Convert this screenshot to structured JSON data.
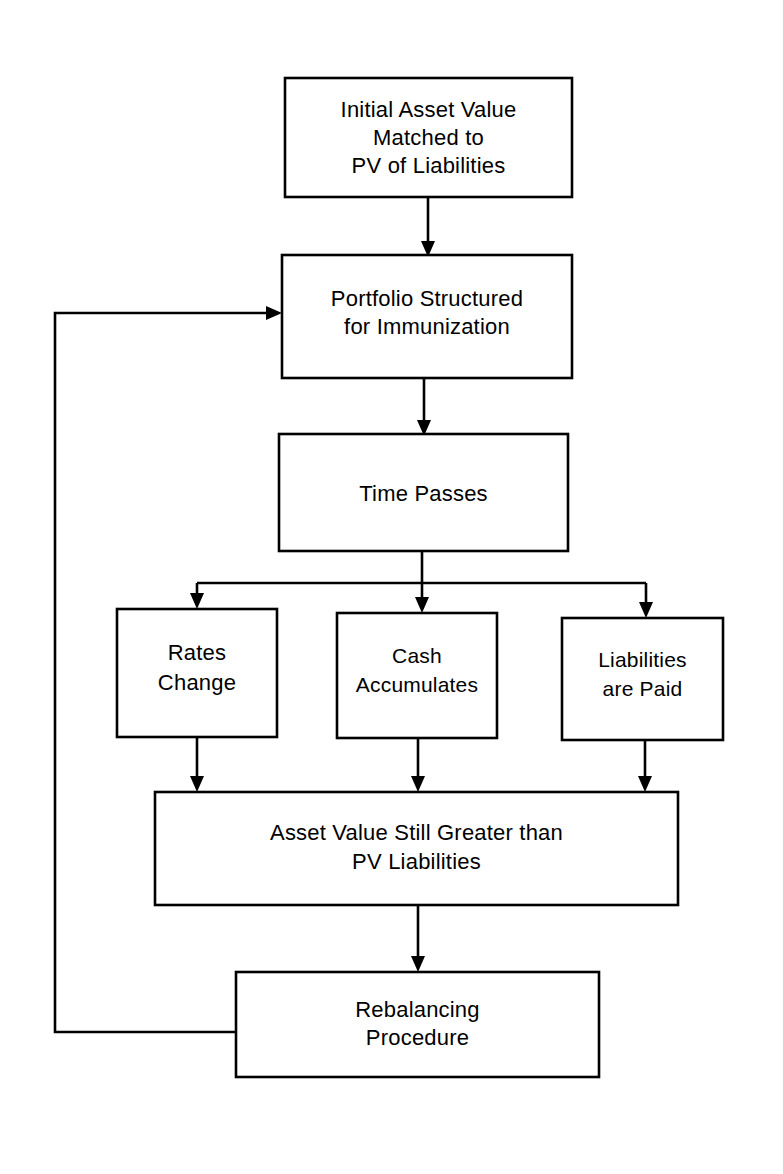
{
  "diagram": {
    "type": "flowchart",
    "background_color": "#ffffff",
    "line_color": "#000000",
    "box_fill": "#ffffff",
    "nodes": [
      {
        "id": "initial-asset-value",
        "lines": [
          "Initial Asset Value",
          "Matched to",
          "PV of Liabilities"
        ],
        "x": 285,
        "y": 78,
        "w": 287,
        "h": 119
      },
      {
        "id": "portfolio-structured",
        "lines": [
          "Portfolio Structured",
          "for Immunization"
        ],
        "x": 282,
        "y": 255,
        "w": 290,
        "h": 123
      },
      {
        "id": "time-passes",
        "lines": [
          "Time Passes"
        ],
        "x": 279,
        "y": 434,
        "w": 289,
        "h": 117
      },
      {
        "id": "rates-change",
        "lines": [
          "Rates",
          "Change"
        ],
        "x": 117,
        "y": 609,
        "w": 160,
        "h": 128
      },
      {
        "id": "cash-accumulates",
        "lines": [
          "Cash",
          "Accumulates"
        ],
        "x": 337,
        "y": 613,
        "w": 160,
        "h": 125
      },
      {
        "id": "liabilities-are-paid",
        "lines": [
          "Liabilities",
          "are  Paid"
        ],
        "x": 562,
        "y": 618,
        "w": 161,
        "h": 122
      },
      {
        "id": "asset-value-still-greater",
        "lines": [
          "Asset Value Still Greater than",
          "PV Liabilities"
        ],
        "x": 155,
        "y": 792,
        "w": 523,
        "h": 113
      },
      {
        "id": "rebalancing-procedure",
        "lines": [
          "Rebalancing",
          "Procedure"
        ],
        "x": 236,
        "y": 972,
        "w": 363,
        "h": 105
      }
    ],
    "edges": [
      {
        "id": "edge-initial-to-portfolio",
        "from": "initial-asset-value",
        "to": "portfolio-structured",
        "arrow": "down"
      },
      {
        "id": "edge-portfolio-to-time",
        "from": "portfolio-structured",
        "to": "time-passes",
        "arrow": "down"
      },
      {
        "id": "edge-time-to-rates",
        "from": "time-passes",
        "to": "rates-change",
        "arrow": "down"
      },
      {
        "id": "edge-time-to-cash",
        "from": "time-passes",
        "to": "cash-accumulates",
        "arrow": "down"
      },
      {
        "id": "edge-time-to-liabilities",
        "from": "time-passes",
        "to": "liabilities-are-paid",
        "arrow": "down"
      },
      {
        "id": "edge-rates-to-asset",
        "from": "rates-change",
        "to": "asset-value-still-greater",
        "arrow": "down"
      },
      {
        "id": "edge-cash-to-asset",
        "from": "cash-accumulates",
        "to": "asset-value-still-greater",
        "arrow": "down"
      },
      {
        "id": "edge-liabilities-to-asset",
        "from": "liabilities-are-paid",
        "to": "asset-value-still-greater",
        "arrow": "down"
      },
      {
        "id": "edge-asset-to-rebalancing",
        "from": "asset-value-still-greater",
        "to": "rebalancing-procedure",
        "arrow": "down"
      },
      {
        "id": "edge-rebalancing-feedback",
        "from": "rebalancing-procedure",
        "to": "portfolio-structured",
        "arrow": "right"
      }
    ]
  }
}
